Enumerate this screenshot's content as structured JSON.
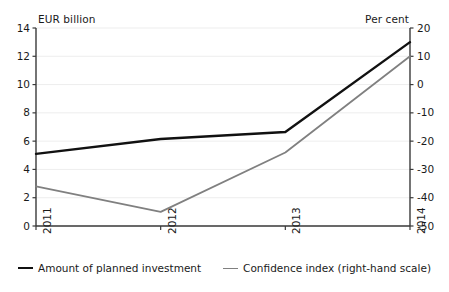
{
  "chart_data": {
    "type": "line",
    "title": "",
    "categories": [
      "2011",
      "2012",
      "2013",
      "2014"
    ],
    "series": [
      {
        "name": "Amount of planned investment",
        "axis": "left",
        "color": "#111111",
        "values": [
          5.1,
          6.15,
          6.65,
          13.0
        ]
      },
      {
        "name": "Confidence index (right-hand scale)",
        "axis": "right",
        "color": "#808080",
        "values": [
          -36,
          -45,
          -24,
          10
        ]
      }
    ],
    "left_axis": {
      "label": "EUR billion",
      "ylim": [
        0,
        14
      ],
      "ticks": [
        "14",
        "12",
        "10",
        "8",
        "6",
        "4",
        "2",
        "0"
      ],
      "tick_values": [
        14,
        12,
        10,
        8,
        6,
        4,
        2,
        0
      ]
    },
    "right_axis": {
      "label": "Per cent",
      "ylim": [
        -50,
        20
      ],
      "ticks": [
        "20",
        "10",
        "0",
        "-10",
        "-20",
        "-30",
        "-40",
        "-50"
      ],
      "tick_values": [
        20,
        10,
        0,
        -10,
        -20,
        -30,
        -40,
        -50
      ]
    },
    "xlabel": "",
    "grid": true,
    "legend_position": "bottom"
  },
  "legend": {
    "items": [
      {
        "label": "Amount of planned investment",
        "color": "#111111"
      },
      {
        "label": "Confidence index (right-hand scale)",
        "color": "#808080"
      }
    ]
  }
}
